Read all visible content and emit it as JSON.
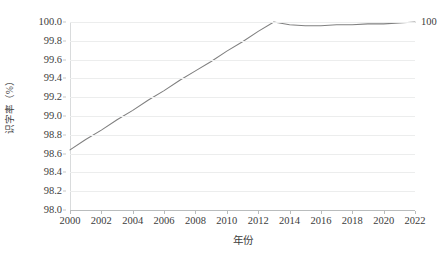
{
  "chart_data": {
    "type": "line",
    "title": "",
    "xlabel": "年份",
    "ylabel": "识字率（%）",
    "xlim": [
      2000,
      2022
    ],
    "ylim": [
      98.0,
      100.0
    ],
    "grid": "horizontal",
    "legend": "none",
    "line_color": "#808080",
    "gridline_color": "#ECEDED",
    "axis_color": "#B9BCBD",
    "x_tick_labels": [
      "2000",
      "2002",
      "2004",
      "2006",
      "2008",
      "2010",
      "2012",
      "2014",
      "2016",
      "2018",
      "2020",
      "2022"
    ],
    "x_tick_values": [
      2000,
      2002,
      2004,
      2006,
      2008,
      2010,
      2012,
      2014,
      2016,
      2018,
      2020,
      2022
    ],
    "y_tick_labels": [
      "100.0",
      "99.8",
      "99.6",
      "99.4",
      "99.2",
      "99.0",
      "98.8",
      "98.6",
      "98.4",
      "98.2",
      "98.0"
    ],
    "y_tick_values": [
      100.0,
      99.8,
      99.6,
      99.4,
      99.2,
      99.0,
      98.8,
      98.6,
      98.4,
      98.2,
      98.0
    ],
    "series": [
      {
        "name": "识字率",
        "x": [
          2000,
          2001,
          2002,
          2003,
          2004,
          2005,
          2006,
          2007,
          2008,
          2009,
          2010,
          2011,
          2012,
          2013,
          2014,
          2015,
          2016,
          2017,
          2018,
          2019,
          2020,
          2021,
          2022
        ],
        "values": [
          98.64,
          98.75,
          98.85,
          98.96,
          99.06,
          99.17,
          99.27,
          99.38,
          99.48,
          99.58,
          99.69,
          99.79,
          99.9,
          100.0,
          99.97,
          99.96,
          99.96,
          99.97,
          99.97,
          99.98,
          99.98,
          99.99,
          100.0
        ]
      }
    ],
    "annotations": [
      {
        "name": "end-value-label",
        "text": "100",
        "x": 2022,
        "y": 100.0
      }
    ]
  }
}
